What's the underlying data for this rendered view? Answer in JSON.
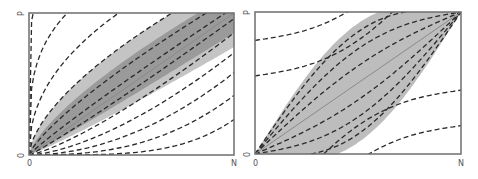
{
  "colors": {
    "frame": "#6e6e6e",
    "dark_band": "#9a9a9a",
    "light_band": "#c4c4c4",
    "lens": "#bdbdbd",
    "dash": "#2a2a2a",
    "diagonal": "#8a8a8a"
  },
  "panels": [
    {
      "id": "left",
      "box": {
        "x0": 29,
        "y0": 13,
        "x1": 234,
        "y1": 155
      },
      "labels": {
        "y_top": "P",
        "y_bottom": "0",
        "x_left": "0",
        "x_right": "N"
      },
      "kind": "power-fan",
      "dashed_exponents": [
        0.12,
        0.28,
        0.45,
        0.62,
        0.78,
        0.92,
        1.08,
        1.28,
        1.55,
        1.95,
        2.6,
        4.0
      ],
      "dashed_scales": [
        1.6,
        1.6,
        1.45,
        1.25,
        1.12,
        1.04,
        0.96,
        0.86,
        0.72,
        0.58,
        0.42,
        0.25
      ],
      "band_light": {
        "upper_scale": 1.25,
        "upper_exp": 0.62,
        "lower_scale": 0.76,
        "lower_exp": 1.1
      },
      "band_dark": {
        "upper_scale": 1.15,
        "upper_exp": 0.72,
        "lower_scale": 0.86,
        "lower_exp": 1.05
      }
    },
    {
      "id": "right",
      "box": {
        "x0": 255,
        "y0": 12,
        "x1": 461,
        "y1": 154
      },
      "labels": {
        "y_top": "P",
        "y_bottom": "0",
        "x_left": "0",
        "x_right": "N"
      },
      "kind": "lens",
      "lens_bulge": [
        0.12,
        0.24,
        0.36,
        -0.12,
        -0.24,
        -0.36
      ],
      "outer_offsets": [
        0.55,
        0.8,
        1.05,
        -0.55,
        -0.8,
        -1.05
      ]
    }
  ],
  "chart_data": [
    {
      "type": "line",
      "title": "",
      "xlabel": "N",
      "ylabel": "P",
      "x_ticks": [
        "0",
        "N"
      ],
      "y_ticks": [
        "0",
        "P"
      ],
      "description": "Fan of dashed isometric curves through the origin; shaded (light and dark gray) band around the diagonal from (0,0) to (N,P); solid diagonal line",
      "grid": false,
      "legend": "none"
    },
    {
      "type": "line",
      "title": "",
      "xlabel": "N",
      "ylabel": "P",
      "x_ticks": [
        "0",
        "N"
      ],
      "y_ticks": [
        "0",
        "P"
      ],
      "description": "Lens-shaped shaded region between (0,0) and (N,P) with dashed curves inside passing through both corners, plus parallel dashed curves outside; solid diagonal line",
      "grid": false,
      "legend": "none"
    }
  ]
}
